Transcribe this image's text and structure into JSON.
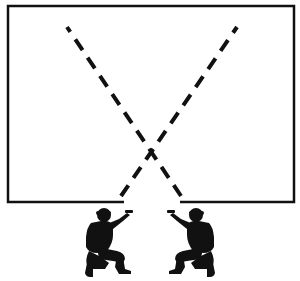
{
  "diagram": {
    "type": "tactical-room-entry",
    "colors": {
      "background": "#ffffff",
      "ink": "#111111"
    },
    "room": {
      "x1": 8,
      "y1": 6,
      "x2": 294,
      "y2": 202,
      "stroke_width": 2.5,
      "doorway": {
        "x_start": 124,
        "x_end": 180
      }
    },
    "fire_lines": [
      {
        "name": "left-soldier-sector",
        "x1": 181,
        "y1": 196,
        "x2": 67,
        "y2": 27
      },
      {
        "name": "right-soldier-sector",
        "x1": 121,
        "y1": 196,
        "x2": 237,
        "y2": 27
      }
    ],
    "dash_pattern": "13 9",
    "crossing_point": {
      "x": 151,
      "y": 152
    },
    "figures": [
      {
        "name": "soldier-left",
        "x": 83,
        "y": 207,
        "facing": "right"
      },
      {
        "name": "soldier-right",
        "x": 217,
        "y": 207,
        "facing": "left"
      }
    ]
  }
}
